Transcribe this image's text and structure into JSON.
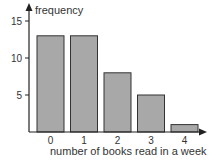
{
  "chart_data": {
    "type": "bar",
    "title": "",
    "xlabel": "number of books read in a week",
    "ylabel": "frequency",
    "categories": [
      "0",
      "1",
      "2",
      "3",
      "4"
    ],
    "values": [
      13,
      13,
      8,
      5,
      1
    ],
    "ylim": [
      0,
      16
    ],
    "yticks": [
      5,
      10,
      15
    ],
    "grid": false,
    "legend": null,
    "bar_color": "#a8a8a8",
    "edge_color": "#333333"
  }
}
